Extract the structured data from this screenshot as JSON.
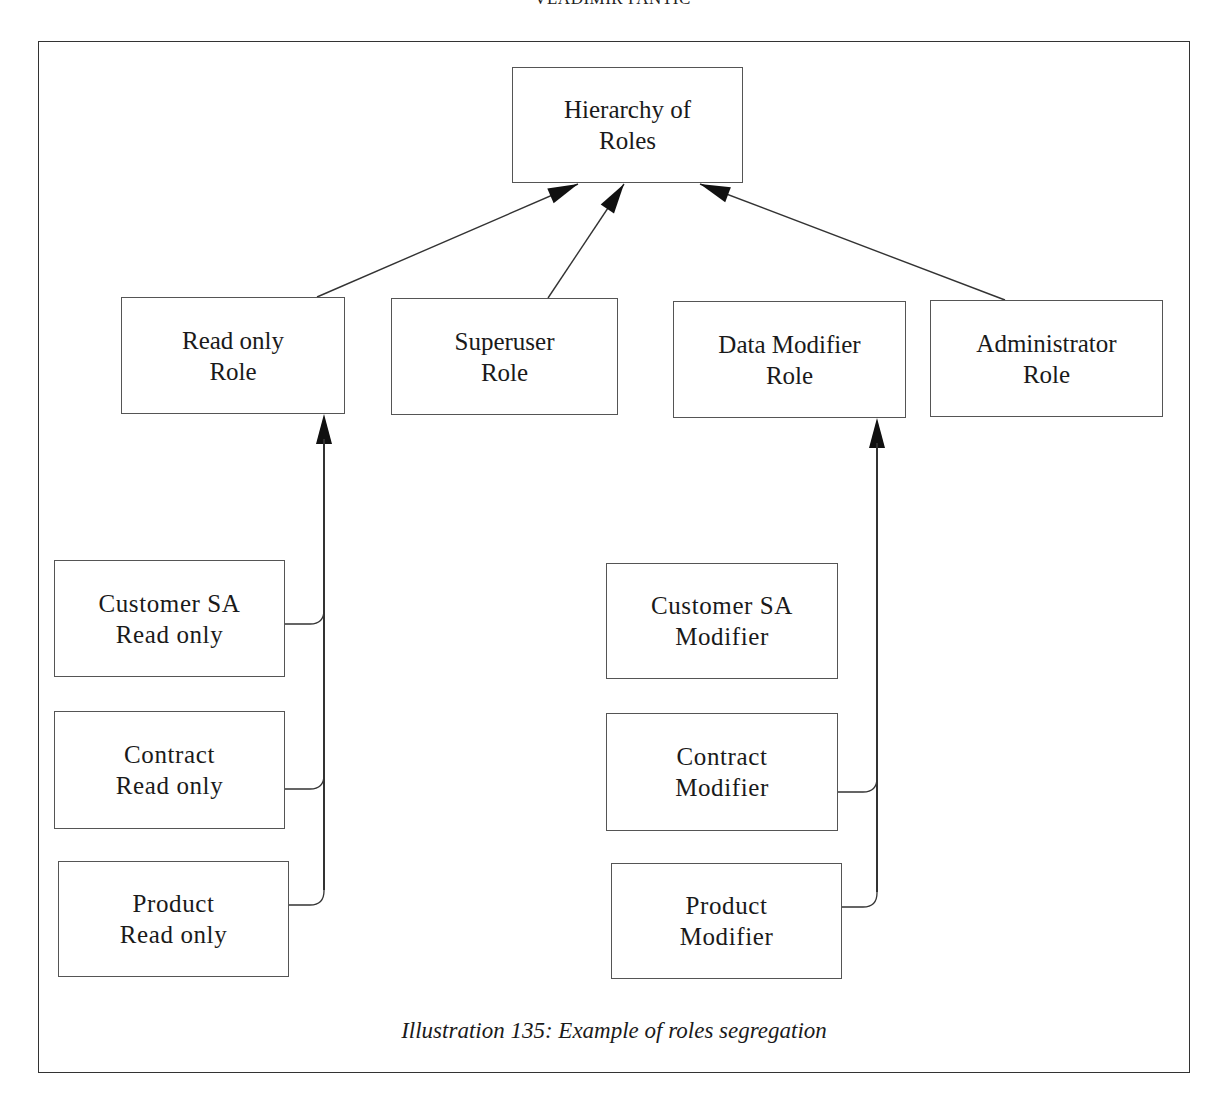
{
  "header": {
    "running_head": "VLADIMIR PANTIC"
  },
  "diagram": {
    "root": {
      "id": "hierarchy",
      "label": "Hierarchy of\nRoles",
      "box": {
        "x": 512,
        "y": 67,
        "w": 231,
        "h": 116
      }
    },
    "roles": [
      {
        "id": "read-only-role",
        "label": "Read only\nRole",
        "box": {
          "x": 121,
          "y": 297,
          "w": 224,
          "h": 117
        }
      },
      {
        "id": "superuser-role",
        "label": "Superuser\nRole",
        "box": {
          "x": 391,
          "y": 298,
          "w": 227,
          "h": 117
        }
      },
      {
        "id": "data-modifier-role",
        "label": "Data Modifier\nRole",
        "box": {
          "x": 673,
          "y": 301,
          "w": 233,
          "h": 117
        }
      },
      {
        "id": "administrator-role",
        "label": "Administrator\nRole",
        "box": {
          "x": 930,
          "y": 300,
          "w": 233,
          "h": 117
        }
      }
    ],
    "read_only_children": [
      {
        "id": "customer-sa-read-only",
        "label": "Customer SA\nRead only",
        "box": {
          "x": 54,
          "y": 560,
          "w": 231,
          "h": 117
        },
        "connector_y": 624
      },
      {
        "id": "contract-read-only",
        "label": "Contract\nRead only",
        "box": {
          "x": 54,
          "y": 711,
          "w": 231,
          "h": 118
        },
        "connector_y": 789
      },
      {
        "id": "product-read-only",
        "label": "Product\nRead only",
        "box": {
          "x": 58,
          "y": 861,
          "w": 231,
          "h": 116
        },
        "connector_y": 905
      }
    ],
    "modifier_children": [
      {
        "id": "customer-sa-modifier",
        "label": "Customer SA\nModifier",
        "box": {
          "x": 606,
          "y": 563,
          "w": 232,
          "h": 116
        },
        "connector_y": null
      },
      {
        "id": "contract-modifier",
        "label": "Contract\nModifier",
        "box": {
          "x": 606,
          "y": 713,
          "w": 232,
          "h": 118
        },
        "connector_y": 792
      },
      {
        "id": "product-modifier",
        "label": "Product\nModifier",
        "box": {
          "x": 611,
          "y": 863,
          "w": 231,
          "h": 116
        },
        "connector_y": 907
      }
    ],
    "edges_to_root": [
      {
        "from": "read-only-role",
        "x1": 317,
        "y1": 297,
        "x2": 578,
        "y2": 184
      },
      {
        "from": "superuser-role",
        "x1": 548,
        "y1": 298,
        "x2": 624,
        "y2": 184
      },
      {
        "from": "administrator-role",
        "x1": 1005,
        "y1": 300,
        "x2": 700,
        "y2": 184
      }
    ],
    "vertical_buses": [
      {
        "to": "read-only-role",
        "x": 324,
        "tip_y": 414,
        "bottom_y": 890
      },
      {
        "to": "data-modifier-role",
        "x": 877,
        "tip_y": 418,
        "bottom_y": 892
      }
    ],
    "line_color": "#333333"
  },
  "caption": {
    "text": "Illustration 135:  Example of roles segregation"
  }
}
